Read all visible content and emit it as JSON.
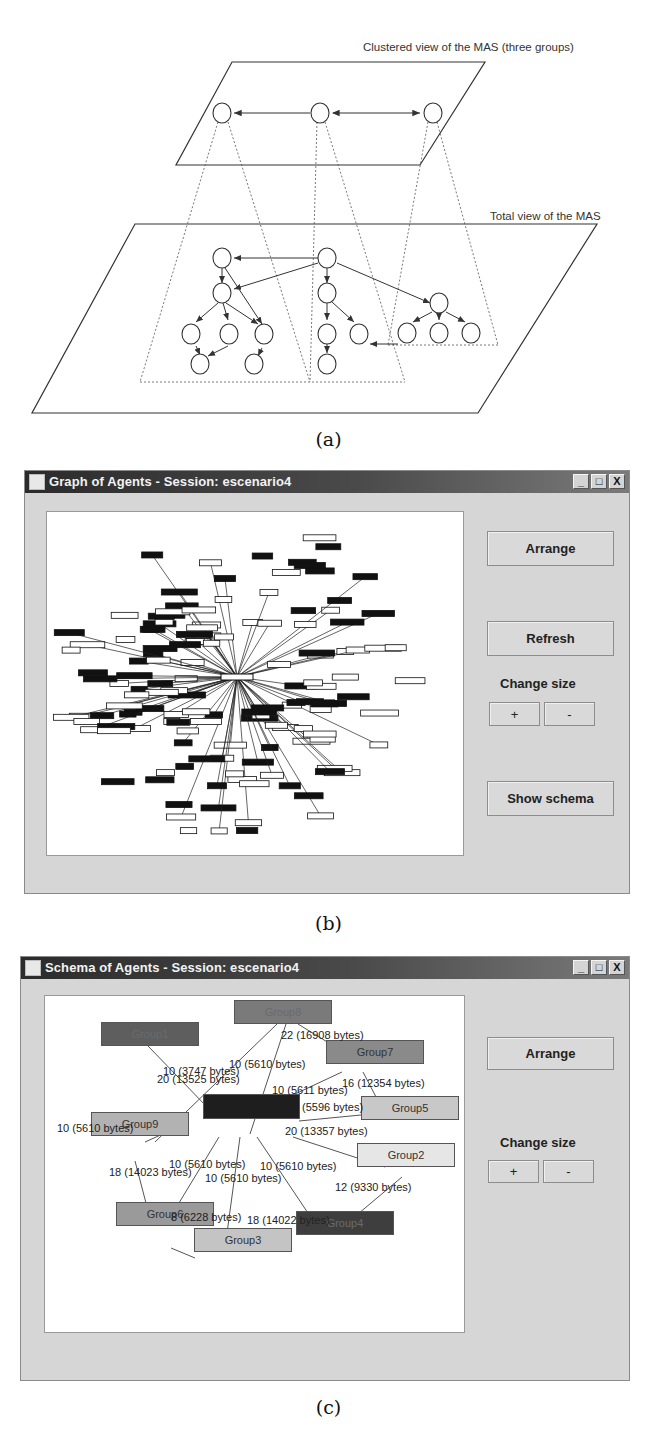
{
  "figure_a": {
    "labels": {
      "clustered_view": "Clustered view of the MAS (three groups)",
      "total_view": "Total view of the MAS"
    },
    "caption": "(a)",
    "top_plane_nodes": 3,
    "bottom_plane_nodes": 19
  },
  "figure_b": {
    "window_title": "Graph of Agents - Session: escenario4",
    "window_controls": {
      "minimize": "_",
      "maximize": "□",
      "close": "X"
    },
    "buttons": {
      "arrange": "Arrange",
      "refresh": "Refresh",
      "plus": "+",
      "minus": "-",
      "show_schema": "Show schema"
    },
    "change_size_label": "Change size",
    "caption": "(b)"
  },
  "figure_c": {
    "window_title": "Schema of Agents - Session: escenario4",
    "window_controls": {
      "minimize": "_",
      "maximize": "□",
      "close": "X"
    },
    "buttons": {
      "arrange": "Arrange",
      "plus": "+",
      "minus": "-"
    },
    "change_size_label": "Change size",
    "groups": [
      {
        "id": "group8",
        "label": "Group8",
        "color": "#7a7a7a"
      },
      {
        "id": "group1",
        "label": "Group1",
        "color": "#5e5e5e"
      },
      {
        "id": "group7",
        "label": "Group7",
        "color": "#8a8a8a"
      },
      {
        "id": "group5",
        "label": "Group5",
        "color": "#c8c8c8"
      },
      {
        "id": "center",
        "label": "",
        "color": "#1e1e1e"
      },
      {
        "id": "group9",
        "label": "Group9",
        "color": "#b2b2b2"
      },
      {
        "id": "group2",
        "label": "Group2",
        "color": "#e6e6e6"
      },
      {
        "id": "group6",
        "label": "Group6",
        "color": "#9a9a9a"
      },
      {
        "id": "group4",
        "label": "Group4",
        "color": "#3e3e3e"
      },
      {
        "id": "group3",
        "label": "Group3",
        "color": "#c4c4c4"
      }
    ],
    "edge_labels": [
      "22 (16908 bytes)",
      "10 (5610 bytes)",
      "10 (3747 bytes)",
      "20 (13525 bytes)",
      "16 (12354 bytes)",
      "10 (5611 bytes)",
      "(5596 bytes)",
      "10 (5610 bytes)",
      "20 (13357 bytes)",
      "10 (5610 bytes)",
      "10 (5610 bytes)",
      "18 (14023 bytes)",
      "10 (5610 bytes)",
      "12 (9330 bytes)",
      "8 (6228 bytes)",
      "18 (14022 bytes)"
    ],
    "caption": "(c)"
  }
}
